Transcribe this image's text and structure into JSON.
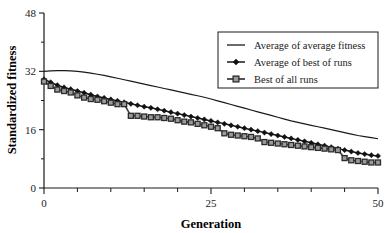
{
  "chart_data": {
    "type": "line",
    "title": "",
    "xlabel": "Generation",
    "ylabel": "Standardized fitness",
    "xlim": [
      0,
      50
    ],
    "ylim": [
      0,
      48
    ],
    "x_ticks": [
      0,
      25,
      50
    ],
    "x_tick_labels": [
      "0",
      "25",
      "50"
    ],
    "x_minor_step": 5,
    "y_ticks": [
      0,
      16,
      32,
      48
    ],
    "y_tick_labels": [
      "0",
      "16",
      "32",
      "48"
    ],
    "y_minor_step": 8,
    "grid": false,
    "legend_position": "top-right",
    "x": [
      0,
      1,
      2,
      3,
      4,
      5,
      6,
      7,
      8,
      9,
      10,
      11,
      12,
      13,
      14,
      15,
      16,
      17,
      18,
      19,
      20,
      21,
      22,
      23,
      24,
      25,
      26,
      27,
      28,
      29,
      30,
      31,
      32,
      33,
      34,
      35,
      36,
      37,
      38,
      39,
      40,
      41,
      42,
      43,
      44,
      45,
      46,
      47,
      48,
      49,
      50
    ],
    "series": [
      {
        "name": "Average  of average fitness",
        "marker": "none",
        "color": "#1a1a1a",
        "values": [
          32.0,
          32.1,
          32.2,
          32.2,
          32.1,
          32.0,
          31.8,
          31.5,
          31.2,
          30.9,
          30.5,
          30.1,
          29.7,
          29.3,
          28.9,
          28.5,
          28.1,
          27.7,
          27.3,
          26.9,
          26.5,
          26.1,
          25.7,
          25.3,
          24.9,
          24.4,
          23.9,
          23.4,
          22.9,
          22.4,
          21.9,
          21.4,
          20.9,
          20.4,
          19.9,
          19.4,
          18.9,
          18.4,
          18.0,
          17.6,
          17.2,
          16.8,
          16.4,
          16.0,
          15.6,
          15.2,
          14.8,
          14.4,
          14.1,
          13.8,
          13.5
        ]
      },
      {
        "name": "Average  of best of runs",
        "marker": "diamond",
        "color": "#111111",
        "values": [
          29.8,
          29.0,
          28.2,
          27.6,
          27.1,
          26.6,
          26.1,
          25.6,
          25.1,
          24.7,
          24.3,
          23.9,
          23.5,
          23.1,
          22.7,
          22.3,
          22.0,
          21.6,
          21.2,
          20.8,
          20.4,
          20.0,
          19.6,
          19.2,
          18.8,
          18.4,
          18.0,
          17.6,
          17.2,
          16.8,
          16.4,
          16.0,
          15.6,
          15.2,
          14.8,
          14.4,
          14.0,
          13.6,
          13.2,
          12.8,
          12.4,
          12.0,
          11.6,
          11.2,
          10.8,
          10.4,
          10.0,
          9.6,
          9.3,
          9.0,
          8.8
        ]
      },
      {
        "name": "Best of all runs",
        "marker": "square",
        "color": "#9a9a9a",
        "values": [
          29.2,
          28.0,
          27.0,
          26.6,
          26.2,
          25.4,
          24.8,
          24.4,
          24.2,
          23.8,
          23.4,
          23.0,
          23.0,
          19.8,
          19.8,
          19.6,
          19.4,
          19.4,
          19.2,
          19.0,
          18.6,
          18.2,
          18.0,
          17.6,
          17.2,
          16.8,
          16.4,
          15.0,
          14.6,
          14.4,
          14.2,
          14.0,
          13.6,
          12.6,
          12.4,
          12.2,
          12.0,
          11.8,
          11.6,
          11.4,
          11.2,
          11.0,
          10.8,
          10.6,
          10.4,
          8.2,
          7.6,
          7.4,
          7.2,
          7.0,
          7.0
        ]
      }
    ]
  },
  "legend": {
    "entries": [
      {
        "label": "Average  of average fitness",
        "marker": "line"
      },
      {
        "label": "Average  of best of runs",
        "marker": "diamond"
      },
      {
        "label": "Best of all runs",
        "marker": "square"
      }
    ]
  }
}
